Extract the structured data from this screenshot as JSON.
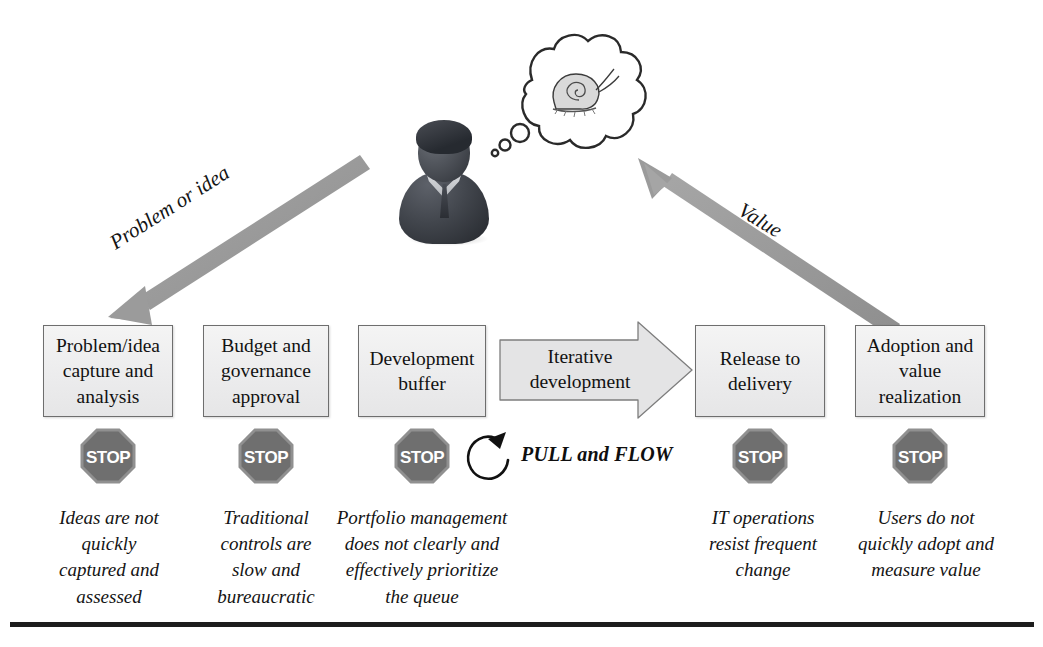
{
  "diagram": {
    "person": {
      "icon": "business-person-avatar",
      "thought_icon": "snail-in-thought-bubble"
    },
    "arrows": [
      {
        "name": "problem-or-idea-arrow",
        "label": "Problem or idea",
        "direction": "down-left"
      },
      {
        "name": "value-arrow",
        "label": "Value",
        "direction": "up-left"
      }
    ],
    "pull_flow_label": "PULL and FLOW",
    "loop_icon": "circular-refresh-arrow",
    "stages": [
      {
        "id": "problem-idea-capture",
        "label": "Problem/idea\ncapture and\nanalysis",
        "shape": "rectangle",
        "stop_icon": "stop-sign",
        "caption": "Ideas are not\nquickly\ncaptured and\nassessed"
      },
      {
        "id": "budget-governance",
        "label": "Budget and\ngovernance\napproval",
        "shape": "rectangle",
        "stop_icon": "stop-sign",
        "caption": "Traditional\ncontrols are\nslow and\nbureaucratic"
      },
      {
        "id": "development-buffer",
        "label": "Development\nbuffer",
        "shape": "rectangle",
        "stop_icon": "stop-sign",
        "caption": "Portfolio management\ndoes not clearly and\neffectively prioritize\nthe queue"
      },
      {
        "id": "iterative-development",
        "label": "Iterative\ndevelopment",
        "shape": "chevron-arrow",
        "stop_icon": null,
        "caption": null
      },
      {
        "id": "release-to-delivery",
        "label": "Release to\ndelivery",
        "shape": "rectangle",
        "stop_icon": "stop-sign",
        "caption": "IT operations\nresist frequent\nchange"
      },
      {
        "id": "adoption-value-realization",
        "label": "Adoption and\nvalue\nrealization",
        "shape": "rectangle",
        "stop_icon": "stop-sign",
        "caption": "Users do not\nquickly adopt and\nmeasure value"
      }
    ],
    "stop_sign_text": "STOP",
    "colors": {
      "box_fill": "#ececed",
      "box_border": "#6e6e6e",
      "chevron_fill": "#e3e3e4",
      "arrow_gray": "#9a9a9a",
      "stop_gray": "#7a7a7a",
      "text": "#141414",
      "rule": "#1d1d1d"
    }
  }
}
